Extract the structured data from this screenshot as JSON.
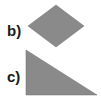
{
  "figures": [
    {
      "label": "b)",
      "shape": "rhombus",
      "fill": "#8a8a8a"
    },
    {
      "label": "c)",
      "shape": "right-triangle",
      "fill": "#8a8a8a"
    }
  ]
}
